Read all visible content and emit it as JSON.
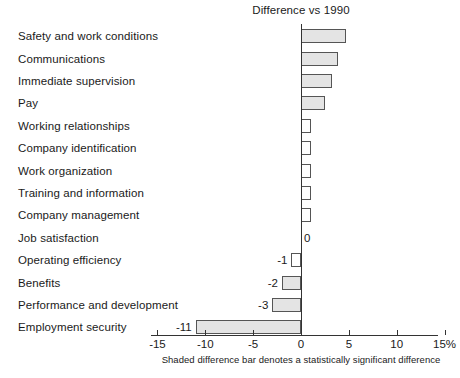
{
  "chart_data": {
    "type": "bar",
    "orientation": "horizontal",
    "title": "Difference vs 1990",
    "xlabel": "",
    "ylabel": "",
    "xlim": [
      -15,
      15
    ],
    "xticks": [
      -15,
      -10,
      -5,
      0,
      5,
      10,
      15
    ],
    "xtick_labels": [
      "-15",
      "-10",
      "-5",
      "0",
      "5",
      "10",
      "15%"
    ],
    "grid": false,
    "legend": null,
    "footnote": "Shaded difference bar denotes a statistically significant difference",
    "zero_reference": 0,
    "categories": [
      "Safety and work conditions",
      "Communications",
      "Immediate supervision",
      "Pay",
      "Working relationships",
      "Company identification",
      "Work organization",
      "Training and information",
      "Company management",
      "Job satisfaction",
      "Operating efficiency",
      "Benefits",
      "Performance and development",
      "Employment security"
    ],
    "values": [
      4.7,
      3.9,
      3.2,
      2.5,
      1.0,
      1.0,
      1.0,
      1.0,
      1.0,
      0,
      -1,
      -2,
      -3,
      -11
    ],
    "significant": [
      true,
      true,
      true,
      true,
      false,
      false,
      false,
      false,
      false,
      false,
      false,
      true,
      true,
      true
    ],
    "data_labels": [
      "",
      "",
      "",
      "",
      "",
      "",
      "",
      "",
      "",
      "0",
      "-1",
      "-2",
      "-3",
      "-11"
    ]
  }
}
